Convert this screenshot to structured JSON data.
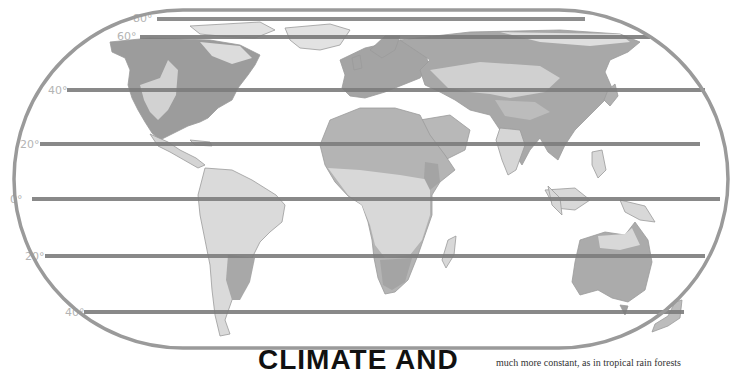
{
  "map": {
    "title": "World climate zones",
    "frame_shape": "stadium",
    "colors": {
      "frame": "#9a9a9a",
      "latitude_line": "#8e8e8e",
      "latitude_line_dark": "#6e6e6e",
      "zone_dark": "#9c9c9c",
      "zone_medium": "#b8b8b8",
      "zone_light": "#d6d6d6",
      "zone_pale": "#e6e6e6",
      "coast": "#9a9a9a",
      "label": "#b4b4b4"
    },
    "latitude_lines": [
      {
        "label": "80°",
        "y": 19,
        "label_x": 108
      },
      {
        "label": "60°",
        "y": 37,
        "label_x": 118
      },
      {
        "label": "40°",
        "y": 90,
        "label_x": 48
      },
      {
        "label": "20°",
        "y": 144,
        "label_x": 20
      },
      {
        "label": "0°",
        "y": 199,
        "label_x": 10
      },
      {
        "label": "20°",
        "y": 256,
        "label_x": 25
      },
      {
        "label": "40°",
        "y": 312,
        "label_x": 65
      }
    ],
    "continents": [
      "North America",
      "South America",
      "Europe",
      "Africa",
      "Asia",
      "Australia",
      "Greenland",
      "New Zealand"
    ]
  },
  "article": {
    "heading": "CLIMATE AND",
    "body_fragment": "much more constant, as in tropical rain forests"
  }
}
